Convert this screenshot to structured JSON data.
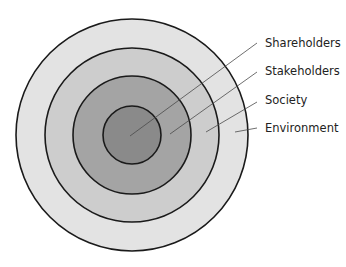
{
  "diagram": {
    "type": "concentric-circles",
    "center": {
      "x": 132,
      "y": 135
    },
    "rings": [
      {
        "name": "environment",
        "label": "Environment",
        "radius": 116,
        "fill": "#e3e3e3"
      },
      {
        "name": "society",
        "label": "Society",
        "radius": 87,
        "fill": "#cdcdcd"
      },
      {
        "name": "stakeholders",
        "label": "Stakeholders",
        "radius": 59,
        "fill": "#a4a4a4"
      },
      {
        "name": "shareholders",
        "label": "Shareholders",
        "radius": 29,
        "fill": "#8a8a8a"
      }
    ],
    "labels": [
      {
        "text": "Shareholders",
        "x": 265,
        "y": 47,
        "line": {
          "x1": 257,
          "y1": 43,
          "x2": 130,
          "y2": 136
        }
      },
      {
        "text": "Stakeholders",
        "x": 265,
        "y": 75,
        "line": {
          "x1": 257,
          "y1": 72,
          "x2": 170,
          "y2": 134
        }
      },
      {
        "text": "Society",
        "x": 265,
        "y": 104,
        "line": {
          "x1": 257,
          "y1": 102,
          "x2": 206,
          "y2": 132
        }
      },
      {
        "text": "Environment",
        "x": 265,
        "y": 132,
        "line": {
          "x1": 257,
          "y1": 128,
          "x2": 235,
          "y2": 132
        }
      }
    ]
  }
}
